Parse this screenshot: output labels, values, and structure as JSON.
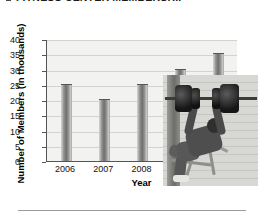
{
  "title": {
    "text": "FITNESS CENTER MEMBERSHIP",
    "bullet_icon": "square-bullet-icon"
  },
  "chart_data": {
    "type": "bar",
    "title": "FITNESS CENTER MEMBERSHIP",
    "categories": [
      "2006",
      "2007",
      "2008",
      "2009",
      "2010"
    ],
    "values": [
      25,
      20,
      25,
      30,
      35
    ],
    "xlabel": "Year",
    "ylabel": "Number of Members (in thousands)",
    "ylim": [
      0,
      40
    ],
    "ytick_labels": [
      "0",
      "5",
      "10",
      "15",
      "20",
      "25",
      "30",
      "35",
      "40"
    ],
    "ytick_values": [
      0,
      5,
      10,
      15,
      20,
      25,
      30,
      35,
      40
    ],
    "grid": true,
    "legend": false,
    "bar_color": "#6e6e6c",
    "plot_background": "#f2f2f0",
    "gridline_color": "#d2d2cf",
    "axis_color": "#555555"
  },
  "photo": {
    "alt": "person bench pressing a barbell in a gym",
    "icon": "weightlifter-photo"
  }
}
